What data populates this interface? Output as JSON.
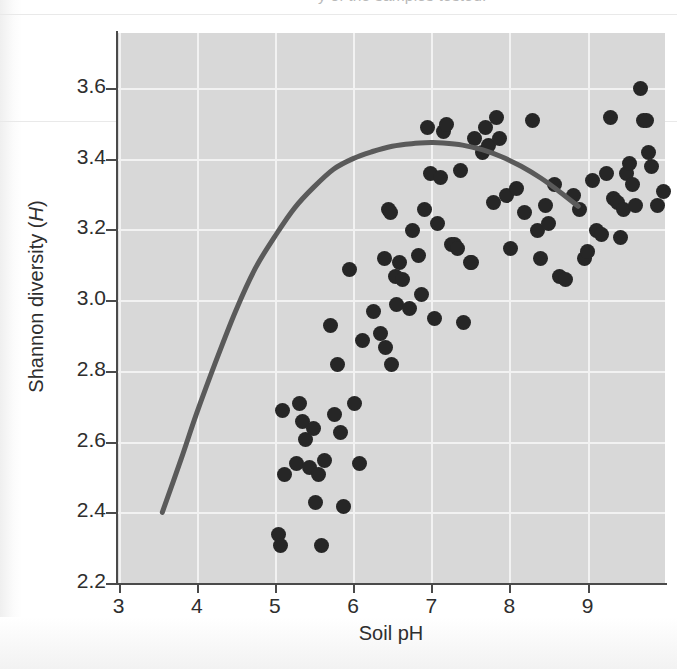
{
  "page": {
    "caption_fragment": "y of the samples tested."
  },
  "chart_data": {
    "type": "scatter",
    "title": "",
    "xlabel": "Soil pH",
    "ylabel": "Shannon diversity (H)",
    "ylabel_plain": "Shannon diversity",
    "ylabel_italic_symbol": "H",
    "xlim": [
      2.98,
      9.99
    ],
    "ylim": [
      2.2,
      3.755
    ],
    "xticks": [
      3,
      4,
      5,
      6,
      7,
      8,
      9
    ],
    "xtick_labels": [
      "3",
      "4",
      "5",
      "6",
      "7",
      "8",
      "9"
    ],
    "yticks": [
      2.2,
      2.4,
      2.6,
      2.8,
      3.0,
      3.2,
      3.4,
      3.6
    ],
    "ytick_labels": [
      "2.2",
      "2.4",
      "2.6",
      "2.8",
      "3.0",
      "3.2",
      "3.4",
      "3.6"
    ],
    "grid": true,
    "grid_color": "#f2f2f2",
    "plot_background": "#d8d8d8",
    "point_color": "#262626",
    "point_size_px": 15,
    "legend": null,
    "series": [
      {
        "name": "Soil samples",
        "marker": "circle",
        "points": [
          [
            3.55,
            2.43
          ],
          [
            3.57,
            2.4
          ],
          [
            3.6,
            2.78
          ],
          [
            3.62,
            2.6
          ],
          [
            3.78,
            2.63
          ],
          [
            3.82,
            2.8
          ],
          [
            3.86,
            2.75
          ],
          [
            3.9,
            2.7
          ],
          [
            3.95,
            2.62
          ],
          [
            4.0,
            2.73
          ],
          [
            4.02,
            2.52
          ],
          [
            4.06,
            2.6
          ],
          [
            4.1,
            2.4
          ],
          [
            4.14,
            2.64
          ],
          [
            4.22,
            3.02
          ],
          [
            4.26,
            2.77
          ],
          [
            4.3,
            2.91
          ],
          [
            4.34,
            2.72
          ],
          [
            4.38,
            2.51
          ],
          [
            4.46,
            3.18
          ],
          [
            4.52,
            2.8
          ],
          [
            4.58,
            2.63
          ],
          [
            4.62,
            2.98
          ],
          [
            4.76,
            3.06
          ],
          [
            4.86,
            3.0
          ],
          [
            4.9,
            3.21
          ],
          [
            4.92,
            2.96
          ],
          [
            4.95,
            3.35
          ],
          [
            4.98,
            3.34
          ],
          [
            5.0,
            2.91
          ],
          [
            5.04,
            3.16
          ],
          [
            5.06,
            3.08
          ],
          [
            5.1,
            3.2
          ],
          [
            5.14,
            3.15
          ],
          [
            5.22,
            3.07
          ],
          [
            5.26,
            3.29
          ],
          [
            5.34,
            3.22
          ],
          [
            5.38,
            3.11
          ],
          [
            5.42,
            3.35
          ],
          [
            5.46,
            3.58
          ],
          [
            5.5,
            3.45
          ],
          [
            5.54,
            3.04
          ],
          [
            5.58,
            3.31
          ],
          [
            5.62,
            3.44
          ],
          [
            5.66,
            3.57
          ],
          [
            5.7,
            3.59
          ],
          [
            5.76,
            3.25
          ],
          [
            5.8,
            3.25
          ],
          [
            5.84,
            3.24
          ],
          [
            5.88,
            3.46
          ],
          [
            5.92,
            3.03
          ],
          [
            6.0,
            3.2
          ],
          [
            6.02,
            3.2
          ],
          [
            6.06,
            3.55
          ],
          [
            6.16,
            3.51
          ],
          [
            6.2,
            3.58
          ],
          [
            6.24,
            3.53
          ],
          [
            6.3,
            3.37
          ],
          [
            6.34,
            3.61
          ],
          [
            6.38,
            3.55
          ],
          [
            6.46,
            3.39
          ],
          [
            6.52,
            3.24
          ],
          [
            6.6,
            3.41
          ],
          [
            6.7,
            3.34
          ],
          [
            6.8,
            3.6
          ],
          [
            6.86,
            3.29
          ],
          [
            6.9,
            3.21
          ],
          [
            6.96,
            3.36
          ],
          [
            7.0,
            3.31
          ],
          [
            7.08,
            3.42
          ],
          [
            7.14,
            3.16
          ],
          [
            7.22,
            3.15
          ],
          [
            7.32,
            3.39
          ],
          [
            7.4,
            3.35
          ],
          [
            7.46,
            3.21
          ],
          [
            7.5,
            3.23
          ],
          [
            7.56,
            3.43
          ],
          [
            7.62,
            3.29
          ],
          [
            7.68,
            3.28
          ],
          [
            7.74,
            3.45
          ],
          [
            7.8,
            3.61
          ],
          [
            7.84,
            3.38
          ],
          [
            7.88,
            3.37
          ],
          [
            7.92,
            3.27
          ],
          [
            7.96,
            3.35
          ],
          [
            8.0,
            3.45
          ],
          [
            8.04,
            3.48
          ],
          [
            8.08,
            3.42
          ],
          [
            8.12,
            3.36
          ],
          [
            8.18,
            3.69
          ],
          [
            8.22,
            3.6
          ],
          [
            8.26,
            3.6
          ],
          [
            8.28,
            3.51
          ],
          [
            8.32,
            3.47
          ],
          [
            8.4,
            3.36
          ],
          [
            8.48,
            3.4
          ],
          [
            8.86,
            3.2
          ],
          [
            9.13,
            2.86
          ]
        ]
      }
    ],
    "fit_curve": {
      "name": "Quadratic fit",
      "color": "#5a5a5a",
      "width_px": 5,
      "points": [
        [
          3.56,
          2.4
        ],
        [
          3.8,
          2.55
        ],
        [
          4.0,
          2.68
        ],
        [
          4.25,
          2.83
        ],
        [
          4.5,
          2.97
        ],
        [
          4.75,
          3.09
        ],
        [
          5.0,
          3.18
        ],
        [
          5.25,
          3.26
        ],
        [
          5.5,
          3.32
        ],
        [
          5.75,
          3.37
        ],
        [
          6.0,
          3.4
        ],
        [
          6.25,
          3.42
        ],
        [
          6.5,
          3.435
        ],
        [
          6.75,
          3.442
        ],
        [
          7.0,
          3.445
        ],
        [
          7.15,
          3.444
        ],
        [
          7.4,
          3.438
        ],
        [
          7.65,
          3.425
        ],
        [
          7.9,
          3.405
        ],
        [
          8.15,
          3.378
        ],
        [
          8.4,
          3.345
        ],
        [
          8.65,
          3.305
        ],
        [
          8.88,
          3.265
        ]
      ]
    }
  }
}
